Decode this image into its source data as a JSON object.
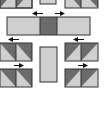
{
  "diagram": {
    "title": "",
    "colors": {
      "dark": "#6b6b6b",
      "light": "#cfcfcf",
      "outline": "#333333",
      "arrow": "#111111",
      "background": "#ffffff"
    },
    "components": [
      {
        "id": "top-left-hst-pair",
        "type": "hst-pair"
      },
      {
        "id": "top-center-rect",
        "type": "rect",
        "shade": "light"
      },
      {
        "id": "top-right-hst-pair",
        "type": "hst-pair"
      },
      {
        "id": "sashing-strip",
        "type": "strip",
        "segments": [
          "light",
          "dark",
          "light"
        ]
      },
      {
        "id": "left-hst-pair-row1",
        "type": "hst-pair"
      },
      {
        "id": "right-hst-pair-row1",
        "type": "hst-pair"
      },
      {
        "id": "center-rect",
        "type": "rect",
        "shade": "light"
      },
      {
        "id": "left-hst-pair-row2",
        "type": "hst-pair"
      },
      {
        "id": "right-hst-pair-row2",
        "type": "hst-pair"
      }
    ],
    "arrows": [
      {
        "id": "arrow-top-left",
        "direction": "left"
      },
      {
        "id": "arrow-top-right",
        "direction": "right"
      },
      {
        "id": "arrow-mid-left",
        "direction": "left"
      },
      {
        "id": "arrow-mid-right",
        "direction": "left"
      },
      {
        "id": "arrow-low-left",
        "direction": "right"
      },
      {
        "id": "arrow-low-right",
        "direction": "right"
      }
    ]
  }
}
